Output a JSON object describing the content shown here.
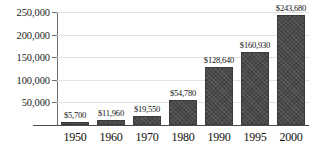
{
  "chart_data": {
    "type": "bar",
    "title": "",
    "xlabel": "",
    "ylabel": "",
    "categories": [
      "1950",
      "1960",
      "1970",
      "1980",
      "1990",
      "1995",
      "2000"
    ],
    "values": [
      5700,
      11960,
      19550,
      54780,
      128640,
      160930,
      243680
    ],
    "value_labels": [
      "$5,700",
      "$11,960",
      "$19,550",
      "$54,780",
      "$128,640",
      "$160,930",
      "$243,680"
    ],
    "ylim": [
      0,
      250000
    ],
    "yticks": [
      50000,
      100000,
      150000,
      200000,
      250000
    ],
    "ytick_labels": [
      "50,000",
      "100,000",
      "150,000",
      "200,000",
      "250,000"
    ],
    "grid": true,
    "legend": null,
    "bar_color": "#4a4a4a",
    "gridline_color": "#e2e2e2",
    "axis_color": "#4d4d4d"
  }
}
